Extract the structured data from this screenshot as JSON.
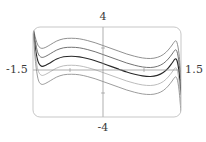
{
  "figure": {
    "frame": {
      "x_min_px": 33,
      "x_max_px": 181,
      "y_min_px": 27,
      "y_max_px": 117,
      "corner_radius_px": 7,
      "stroke_color": "#b9b9b9"
    },
    "axes": {
      "x_axis_y_px": 70,
      "y_axis_x_px": 103,
      "stroke_color": "#8c8c8c"
    },
    "curve_colors": [
      "#7d7d7d",
      "#5a5a5a",
      "#2a2a2a",
      "#b0b0b0",
      "#8a8a8a"
    ]
  },
  "labels": {
    "top": "4",
    "bottom": "-4",
    "left": "-1.5",
    "right": "1.5"
  },
  "chart_data": {
    "type": "line",
    "title": "",
    "xlabel": "",
    "ylabel": "",
    "xlim": [
      -1.5,
      1.5
    ],
    "ylim": [
      -4,
      4
    ],
    "grid": false,
    "legend": null,
    "x_tick_labels": [
      "-1.5",
      "1.5"
    ],
    "y_tick_labels": [
      "-4",
      "4"
    ],
    "axis_labels": {
      "x_left": "-1.5",
      "x_right": "1.5",
      "y_top": "4",
      "y_bottom": "-4"
    },
    "series": [
      {
        "name": "curve-1",
        "color": "#7d7d7d",
        "offset": 1.6,
        "x": [
          -1.5,
          -1.46,
          -1.42,
          -1.38,
          -1.32,
          -1.24,
          -1.14,
          -1.02,
          -0.88,
          -0.72,
          -0.56,
          -0.4,
          -0.24,
          -0.08,
          0.08,
          0.24,
          0.4,
          0.56,
          0.72,
          0.88,
          1.02,
          1.14,
          1.24,
          1.32,
          1.38,
          1.42,
          1.46,
          1.5
        ],
        "y": [
          4.0,
          3.2,
          2.6,
          2.25,
          2.1,
          2.2,
          2.45,
          2.75,
          2.95,
          3.0,
          2.95,
          2.8,
          2.6,
          2.35,
          2.1,
          1.85,
          1.6,
          1.4,
          1.25,
          1.2,
          1.3,
          1.55,
          1.95,
          2.4,
          2.75,
          2.6,
          1.6,
          -0.4
        ]
      },
      {
        "name": "curve-2",
        "color": "#5a5a5a",
        "offset": 0.8,
        "x": [
          -1.5,
          -1.46,
          -1.42,
          -1.38,
          -1.32,
          -1.24,
          -1.14,
          -1.02,
          -0.88,
          -0.72,
          -0.56,
          -0.4,
          -0.24,
          -0.08,
          0.08,
          0.24,
          0.4,
          0.56,
          0.72,
          0.88,
          1.02,
          1.14,
          1.24,
          1.32,
          1.38,
          1.42,
          1.46,
          1.5
        ],
        "y": [
          4.0,
          2.9,
          2.0,
          1.5,
          1.3,
          1.4,
          1.65,
          1.95,
          2.15,
          2.2,
          2.15,
          2.0,
          1.8,
          1.55,
          1.3,
          1.05,
          0.8,
          0.6,
          0.45,
          0.4,
          0.5,
          0.75,
          1.15,
          1.6,
          1.95,
          1.8,
          0.8,
          -1.2
        ]
      },
      {
        "name": "curve-3",
        "color": "#2a2a2a",
        "offset": 0.0,
        "x": [
          -1.5,
          -1.46,
          -1.42,
          -1.38,
          -1.32,
          -1.24,
          -1.14,
          -1.02,
          -0.88,
          -0.72,
          -0.56,
          -0.4,
          -0.24,
          -0.08,
          0.08,
          0.24,
          0.4,
          0.56,
          0.72,
          0.88,
          1.02,
          1.14,
          1.24,
          1.32,
          1.38,
          1.42,
          1.46,
          1.5
        ],
        "y": [
          4.0,
          2.4,
          1.3,
          0.75,
          0.5,
          0.6,
          0.85,
          1.15,
          1.35,
          1.4,
          1.35,
          1.2,
          1.0,
          0.75,
          0.5,
          0.25,
          0.0,
          -0.2,
          -0.35,
          -0.4,
          -0.3,
          -0.05,
          0.35,
          0.8,
          1.15,
          1.0,
          0.0,
          -2.0
        ]
      },
      {
        "name": "curve-4",
        "color": "#b0b0b0",
        "offset": -0.8,
        "x": [
          -1.5,
          -1.46,
          -1.42,
          -1.38,
          -1.32,
          -1.24,
          -1.14,
          -1.02,
          -0.88,
          -0.72,
          -0.56,
          -0.4,
          -0.24,
          -0.08,
          0.08,
          0.24,
          0.4,
          0.56,
          0.72,
          0.88,
          1.02,
          1.14,
          1.24,
          1.32,
          1.38,
          1.42,
          1.46,
          1.5
        ],
        "y": [
          4.0,
          1.9,
          0.6,
          -0.05,
          -0.3,
          -0.2,
          0.05,
          0.35,
          0.55,
          0.6,
          0.55,
          0.4,
          0.2,
          -0.05,
          -0.3,
          -0.55,
          -0.8,
          -1.0,
          -1.15,
          -1.2,
          -1.1,
          -0.85,
          -0.45,
          0.0,
          0.35,
          0.2,
          -0.8,
          -2.8
        ]
      },
      {
        "name": "curve-5",
        "color": "#8a8a8a",
        "offset": -1.6,
        "x": [
          -1.5,
          -1.46,
          -1.42,
          -1.38,
          -1.32,
          -1.24,
          -1.14,
          -1.02,
          -0.88,
          -0.72,
          -0.56,
          -0.4,
          -0.24,
          -0.08,
          0.08,
          0.24,
          0.4,
          0.56,
          0.72,
          0.88,
          1.02,
          1.14,
          1.24,
          1.32,
          1.38,
          1.42,
          1.46,
          1.5
        ],
        "y": [
          4.0,
          1.4,
          -0.1,
          -0.85,
          -1.1,
          -1.0,
          -0.75,
          -0.45,
          -0.25,
          -0.2,
          -0.25,
          -0.4,
          -0.6,
          -0.85,
          -1.1,
          -1.35,
          -1.6,
          -1.8,
          -1.95,
          -2.0,
          -1.9,
          -1.65,
          -1.25,
          -0.8,
          -0.45,
          -0.6,
          -1.6,
          -3.6
        ]
      }
    ]
  }
}
